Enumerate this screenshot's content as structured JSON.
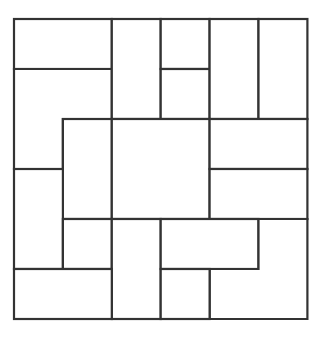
{
  "diagram": {
    "grid": {
      "origin_x": 14,
      "origin_y": 19,
      "cell_w": 48.9,
      "cell_h": 50,
      "cols": 6,
      "rows": 6
    },
    "stroke_color": "#333333",
    "fill_color": "#ffffff",
    "stroke_width": 2.2,
    "pieces": [
      {
        "id": "p1",
        "shape": "rect",
        "cells": [
          [
            0,
            0,
            2,
            1
          ]
        ]
      },
      {
        "id": "p2",
        "shape": "L",
        "points": [
          [
            0,
            1
          ],
          [
            2,
            1
          ],
          [
            2,
            2
          ],
          [
            1,
            2
          ],
          [
            1,
            3
          ],
          [
            0,
            3
          ]
        ]
      },
      {
        "id": "p3",
        "shape": "rect",
        "cells": [
          [
            2,
            0,
            1,
            2
          ]
        ]
      },
      {
        "id": "p4",
        "shape": "rect",
        "cells": [
          [
            3,
            0,
            1,
            1
          ]
        ]
      },
      {
        "id": "p5",
        "shape": "rect",
        "cells": [
          [
            3,
            1,
            1,
            1
          ]
        ]
      },
      {
        "id": "p6",
        "shape": "rect",
        "cells": [
          [
            4,
            0,
            1,
            2
          ]
        ]
      },
      {
        "id": "p7",
        "shape": "rect",
        "cells": [
          [
            5,
            0,
            1,
            2
          ]
        ]
      },
      {
        "id": "p8",
        "shape": "rect",
        "cells": [
          [
            1,
            2,
            1,
            2
          ]
        ]
      },
      {
        "id": "p9",
        "shape": "rect",
        "cells": [
          [
            2,
            2,
            2,
            2
          ]
        ]
      },
      {
        "id": "p10",
        "shape": "rect",
        "cells": [
          [
            4,
            2,
            2,
            1
          ]
        ]
      },
      {
        "id": "p11",
        "shape": "rect",
        "cells": [
          [
            4,
            3,
            2,
            1
          ]
        ]
      },
      {
        "id": "p12",
        "shape": "rect",
        "cells": [
          [
            0,
            3,
            1,
            2
          ]
        ]
      },
      {
        "id": "p13",
        "shape": "rect",
        "cells": [
          [
            1,
            4,
            1,
            1
          ]
        ]
      },
      {
        "id": "p14",
        "shape": "rect",
        "cells": [
          [
            2,
            4,
            1,
            2
          ]
        ]
      },
      {
        "id": "p15",
        "shape": "rect",
        "cells": [
          [
            3,
            4,
            2,
            1
          ]
        ]
      },
      {
        "id": "p16",
        "shape": "L",
        "points": [
          [
            5,
            4
          ],
          [
            6,
            4
          ],
          [
            6,
            6
          ],
          [
            4,
            6
          ],
          [
            4,
            5
          ],
          [
            5,
            5
          ]
        ]
      },
      {
        "id": "p17",
        "shape": "rect",
        "cells": [
          [
            0,
            5,
            2,
            1
          ]
        ]
      },
      {
        "id": "p18",
        "shape": "rect",
        "cells": [
          [
            3,
            5,
            1,
            1
          ]
        ]
      }
    ]
  }
}
